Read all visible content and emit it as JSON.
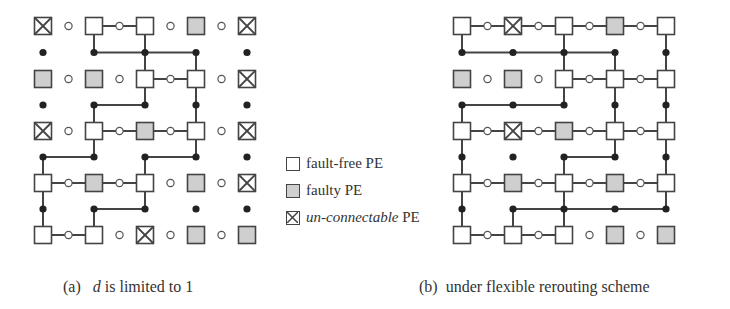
{
  "colors": {
    "stroke": "#444444",
    "fault_free_fill": "#ffffff",
    "faulty_fill": "#cfcfcf",
    "dot": "#222222"
  },
  "legend": {
    "items": [
      {
        "type": "fault-free",
        "label": "fault-free PE"
      },
      {
        "type": "faulty",
        "label": "faulty PE"
      },
      {
        "type": "unconnectable",
        "label_italic": "un-connectable",
        "label_rest": " PE"
      }
    ]
  },
  "captions": {
    "a": {
      "prefix": "(a)",
      "var": "d",
      "rest": " is limited to 1"
    },
    "b": {
      "prefix": "(b)",
      "rest": "under flexible rerouting scheme"
    }
  },
  "grids": [
    {
      "id": "a",
      "cols": [
        43,
        94,
        145,
        196,
        247
      ],
      "rows": [
        26,
        79,
        131,
        183,
        235
      ],
      "pe": [
        [
          "X",
          "F",
          "F",
          "G",
          "X"
        ],
        [
          "G",
          "G",
          "F",
          "F",
          "X"
        ],
        [
          "X",
          "F",
          "G",
          "F",
          "X"
        ],
        [
          "F",
          "G",
          "F",
          "G",
          "X"
        ],
        [
          "F",
          "F",
          "X",
          "G",
          "G"
        ]
      ],
      "hlinks": [
        [
          0,
          1
        ],
        [
          1,
          2
        ],
        [
          2,
          1
        ],
        [
          2,
          2
        ],
        [
          3,
          0
        ],
        [
          3,
          1
        ],
        [
          4,
          0
        ]
      ],
      "bus_segments": [
        [
          0,
          1,
          3
        ],
        [
          1,
          1,
          2
        ],
        [
          2,
          0,
          1
        ],
        [
          2,
          2,
          3
        ],
        [
          3,
          1,
          2
        ]
      ],
      "vlinks": [
        [
          0,
          1,
          "down"
        ],
        [
          0,
          2,
          "full"
        ],
        [
          0,
          3,
          "up"
        ],
        [
          1,
          2,
          "down"
        ],
        [
          1,
          3,
          "full"
        ],
        [
          1,
          1,
          "up"
        ],
        [
          2,
          1,
          "down"
        ],
        [
          2,
          3,
          "down"
        ],
        [
          2,
          0,
          "up"
        ],
        [
          2,
          2,
          "up"
        ],
        [
          3,
          0,
          "full"
        ],
        [
          3,
          2,
          "down"
        ],
        [
          3,
          1,
          "up"
        ]
      ],
      "filled_dots": [
        [
          0,
          1
        ],
        [
          0,
          2
        ],
        [
          0,
          3
        ],
        [
          1,
          1
        ],
        [
          1,
          2
        ],
        [
          1,
          3
        ],
        [
          2,
          0
        ],
        [
          2,
          1
        ],
        [
          2,
          2
        ],
        [
          2,
          3
        ],
        [
          3,
          0
        ],
        [
          3,
          1
        ],
        [
          3,
          2
        ]
      ]
    },
    {
      "id": "b",
      "cols": [
        462,
        513,
        564,
        615,
        666
      ],
      "rows": [
        26,
        79,
        131,
        183,
        235
      ],
      "pe": [
        [
          "F",
          "X",
          "F",
          "G",
          "F"
        ],
        [
          "G",
          "G",
          "F",
          "F",
          "F"
        ],
        [
          "F",
          "X",
          "G",
          "F",
          "F"
        ],
        [
          "F",
          "G",
          "F",
          "G",
          "F"
        ],
        [
          "F",
          "F",
          "F",
          "G",
          "G"
        ]
      ],
      "hlinks": [
        [
          0,
          0
        ],
        [
          0,
          1
        ],
        [
          0,
          2
        ],
        [
          0,
          3
        ],
        [
          1,
          2
        ],
        [
          1,
          3
        ],
        [
          2,
          0
        ],
        [
          2,
          1
        ],
        [
          2,
          2
        ],
        [
          2,
          3
        ],
        [
          3,
          0
        ],
        [
          3,
          1
        ],
        [
          3,
          2
        ],
        [
          3,
          3
        ],
        [
          4,
          0
        ],
        [
          4,
          1
        ]
      ],
      "bus_segments": [
        [
          0,
          0,
          3
        ],
        [
          1,
          0,
          2
        ],
        [
          2,
          2,
          3
        ],
        [
          3,
          1,
          4
        ]
      ],
      "vlinks": [
        [
          0,
          0,
          "down"
        ],
        [
          0,
          2,
          "full"
        ],
        [
          0,
          3,
          "up"
        ],
        [
          0,
          4,
          "full"
        ],
        [
          1,
          2,
          "down"
        ],
        [
          1,
          3,
          "full"
        ],
        [
          1,
          4,
          "full"
        ],
        [
          1,
          0,
          "up"
        ],
        [
          2,
          0,
          "full"
        ],
        [
          2,
          3,
          "down"
        ],
        [
          2,
          4,
          "full"
        ],
        [
          2,
          2,
          "up"
        ],
        [
          3,
          0,
          "full"
        ],
        [
          3,
          2,
          "full"
        ],
        [
          3,
          1,
          "up"
        ],
        [
          3,
          4,
          "down"
        ]
      ],
      "filled_dots": []
    }
  ]
}
